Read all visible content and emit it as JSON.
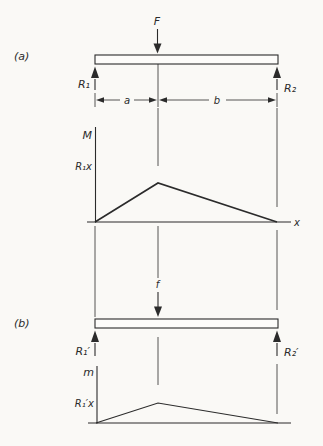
{
  "figure": {
    "title_semantic": "Simply supported beam with concentrated load and bending-moment diagrams",
    "colors": {
      "background": "#faf9f6",
      "ink": "#2b2b2b"
    },
    "panel_a": {
      "tag": "(a)",
      "force_label": "F",
      "reaction_left_label": "R₁",
      "reaction_right_label": "R₂",
      "span_left_label": "a",
      "span_right_label": "b",
      "moment_diagram": {
        "axis_label": "M",
        "peak_value_label": "R₁x",
        "x_axis_label": "x"
      }
    },
    "panel_b": {
      "tag": "(b)",
      "force_label": "f",
      "reaction_left_label": "R₁′",
      "reaction_right_label": "R₂′",
      "moment_diagram": {
        "axis_label": "m",
        "peak_value_label": "R₁′x"
      }
    }
  }
}
